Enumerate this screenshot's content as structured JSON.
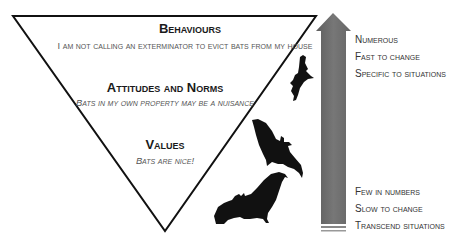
{
  "pyramid": {
    "levels": [
      {
        "title": "Behaviours",
        "example": "I am not calling an exterminator to evict bats from my house"
      },
      {
        "title": "Attitudes and Norms",
        "example": "Bats in my own property may be a nuisance"
      },
      {
        "title": "Values",
        "example": "Bats are nice!"
      }
    ]
  },
  "arrow": {
    "top_labels": [
      "Numerous",
      "Fast to change",
      "Specific to situations"
    ],
    "bottom_labels": [
      "Few in numbers",
      "Slow to change",
      "Transcend situations"
    ],
    "color": "#6e6e6e"
  },
  "decorations": {
    "bats": [
      "bat-small-top",
      "bat-medium-middle",
      "bat-large-bottom"
    ],
    "bat_color": "#111111",
    "line_color": "#111111"
  }
}
